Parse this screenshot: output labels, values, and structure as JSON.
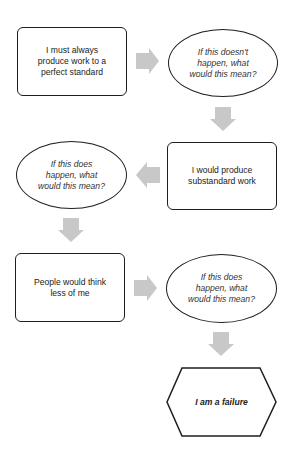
{
  "diagram": {
    "type": "flowchart",
    "arrow_color": "#c8c8c8",
    "border_color": "#1e1e1e",
    "nodes": [
      {
        "id": "n1",
        "shape": "rounded-rect",
        "text": "I must always produce work to a perfect standard"
      },
      {
        "id": "n2",
        "shape": "ellipse",
        "text": "If this doesn't happen, what would this mean?"
      },
      {
        "id": "n3",
        "shape": "rounded-rect",
        "text": "I would produce substandard work"
      },
      {
        "id": "n4",
        "shape": "ellipse",
        "text": "If this does happen, what would this mean?"
      },
      {
        "id": "n5",
        "shape": "rounded-rect",
        "text": "People would think less of me"
      },
      {
        "id": "n6",
        "shape": "ellipse",
        "text": "If this does happen, what would this mean?"
      },
      {
        "id": "n7",
        "shape": "hexagon",
        "text": "I am a failure"
      }
    ],
    "edges": [
      {
        "from": "n1",
        "to": "n2",
        "direction": "right"
      },
      {
        "from": "n2",
        "to": "n3",
        "direction": "down"
      },
      {
        "from": "n3",
        "to": "n4",
        "direction": "left"
      },
      {
        "from": "n4",
        "to": "n5",
        "direction": "down"
      },
      {
        "from": "n5",
        "to": "n6",
        "direction": "right"
      },
      {
        "from": "n6",
        "to": "n7",
        "direction": "down"
      }
    ]
  }
}
